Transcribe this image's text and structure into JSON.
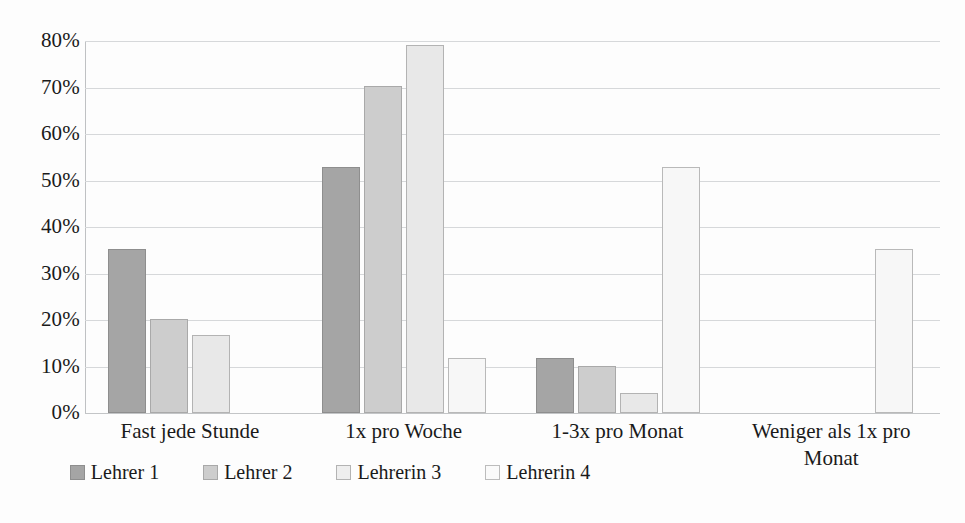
{
  "chart_data": {
    "type": "bar",
    "title": "",
    "subtitle": "",
    "xlabel": "",
    "ylabel": "",
    "ylim": [
      0,
      80
    ],
    "ytick_labels": [
      "0%",
      "10%",
      "20%",
      "30%",
      "40%",
      "50%",
      "60%",
      "70%",
      "80%"
    ],
    "ytick_values": [
      0,
      10,
      20,
      30,
      40,
      50,
      60,
      70,
      80
    ],
    "grid": true,
    "legend_position": "bottom",
    "value_format": "percent",
    "categories": [
      "Fast jede Stunde",
      "1x pro Woche",
      "1-3x pro Monat",
      "Weniger als 1x pro Monat"
    ],
    "series": [
      {
        "name": "Lehrer 1",
        "color": "#a5a5a5",
        "values": [
          35.3,
          53.0,
          11.8,
          0
        ]
      },
      {
        "name": "Lehrer 2",
        "color": "#cdcdcd",
        "values": [
          20.3,
          70.3,
          10.1,
          0
        ]
      },
      {
        "name": "Lehrerin 3",
        "color": "#e8e8e8",
        "values": [
          16.7,
          79.2,
          4.2,
          0
        ]
      },
      {
        "name": "Lehrerin 4",
        "color": "#f7f7f7",
        "values": [
          0,
          11.8,
          52.9,
          35.3
        ]
      }
    ]
  },
  "legend": {
    "items": [
      {
        "label": "Lehrer 1"
      },
      {
        "label": "Lehrer 2"
      },
      {
        "label": "Lehrerin 3"
      },
      {
        "label": "Lehrerin 4"
      }
    ]
  },
  "colors": {
    "series_1": "#a5a5a5",
    "series_2": "#cdcdcd",
    "series_3": "#e8e8e8",
    "series_4": "#f7f7f7",
    "gridline": "#d6d8da",
    "text": "#1a1a1a",
    "background": "#fdfdfd"
  }
}
